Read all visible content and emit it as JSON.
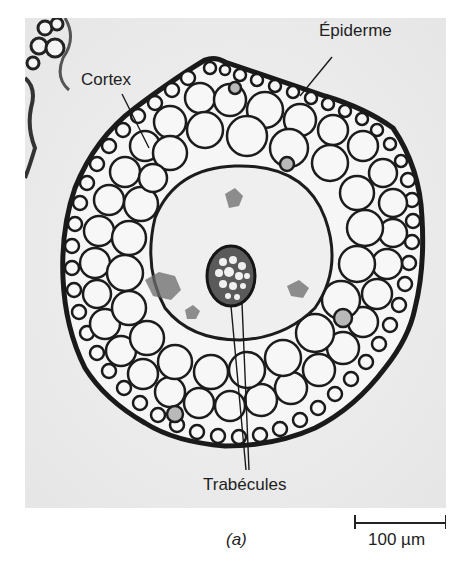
{
  "figure": {
    "panel_label": "(a)",
    "background_color": "#ececec",
    "cell_wall_color": "#1a1a1a",
    "annotations": [
      {
        "id": "epidermis",
        "text": "Épiderme"
      },
      {
        "id": "cortex",
        "text": "Cortex"
      },
      {
        "id": "trabeculae",
        "text": "Trabécules"
      }
    ],
    "scale_bar": {
      "label": "100 µm"
    }
  }
}
